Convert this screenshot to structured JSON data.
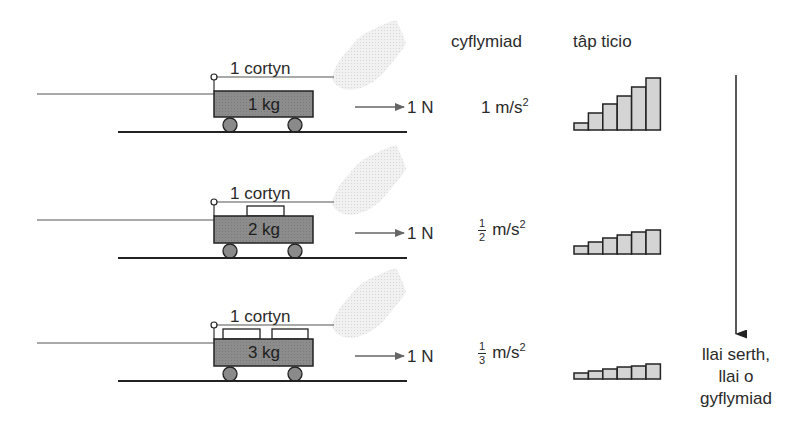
{
  "headers": {
    "acceleration": "cyflymiad",
    "ticker_tape": "tâp ticio"
  },
  "rows": [
    {
      "string_label": "1 cortyn",
      "mass_label": "1 kg",
      "force_label": "1 N",
      "acceleration": {
        "whole": "1",
        "num": "",
        "den": "",
        "unit": "m/s",
        "exp": "2"
      },
      "weights_on_cart": 0,
      "tape_bar_heights_px": [
        7,
        17,
        26,
        34,
        43,
        52
      ]
    },
    {
      "string_label": "1 cortyn",
      "mass_label": "2 kg",
      "force_label": "1 N",
      "acceleration": {
        "whole": "",
        "num": "1",
        "den": "2",
        "unit": "m/s",
        "exp": "2"
      },
      "weights_on_cart": 1,
      "tape_bar_heights_px": [
        8,
        12,
        16,
        19,
        22,
        24
      ]
    },
    {
      "string_label": "1 cortyn",
      "mass_label": "3 kg",
      "force_label": "1 N",
      "acceleration": {
        "whole": "",
        "num": "1",
        "den": "3",
        "unit": "m/s",
        "exp": "2"
      },
      "weights_on_cart": 2,
      "tape_bar_heights_px": [
        6,
        8,
        10,
        12,
        13,
        15
      ]
    }
  ],
  "trend_note": {
    "line1": "llai serth,",
    "line2": "llai o",
    "line3": "gyflymiad"
  },
  "colors": {
    "cart_fill": "#8a8a8a",
    "bar_fill": "#d4d4d4",
    "hand_fill": "#ececec",
    "line": "#2a2a2a",
    "arrow": "#666666"
  }
}
